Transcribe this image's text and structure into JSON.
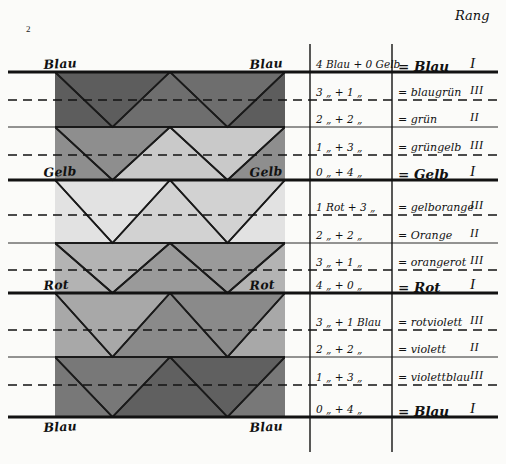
{
  "page": {
    "number": "2"
  },
  "headers": {
    "rank_column": "Rang"
  },
  "axis_labels": {
    "left": [
      {
        "text": "Blau",
        "y": 72
      },
      {
        "text": "Gelb",
        "y": 180
      },
      {
        "text": "Rot",
        "y": 293
      },
      {
        "text": "Blau",
        "y": 435
      }
    ],
    "right": [
      {
        "text": "Blau",
        "y": 72
      },
      {
        "text": "Gelb",
        "y": 180
      },
      {
        "text": "Rot",
        "y": 293
      },
      {
        "text": "Blau",
        "y": 435
      }
    ]
  },
  "colors": {
    "ink": "#111111",
    "paper": "#fbfbf9",
    "tone_blau": "#5d5d5d",
    "tone_blaugruen": "#6e6e6e",
    "tone_gruen": "#8e8e8e",
    "tone_gruengelb": "#c9c9c9",
    "tone_gelb": "#e2e2e2",
    "tone_gelborange": "#d2d2d2",
    "tone_orange": "#b3b3b3",
    "tone_orangerot": "#9a9a9a",
    "tone_rot": "#a8a8a8",
    "tone_rotviolett": "#8a8a8a",
    "tone_violett": "#787878",
    "tone_violettblau": "#606060"
  },
  "chart_data": {
    "type": "table",
    "columns": [
      "Mischung",
      "Ergebnis",
      "Rang"
    ],
    "rows": [
      {
        "mix": "4 Blau + 0 Gelb",
        "result": "= Blau",
        "rank": "I",
        "major": true,
        "sep": "thick"
      },
      {
        "mix": "3  „  + 1  „",
        "result": "= blaugrün",
        "rank": "III",
        "major": false,
        "sep": "dashed"
      },
      {
        "mix": "2  „  + 2  „",
        "result": "= grün",
        "rank": "II",
        "major": false,
        "sep": "solid"
      },
      {
        "mix": "1  „  + 3  „",
        "result": "= grüngelb",
        "rank": "III",
        "major": false,
        "sep": "dashed"
      },
      {
        "mix": "0  „  + 4  „",
        "result": "= Gelb",
        "rank": "I",
        "major": true,
        "sep": "thick"
      },
      {
        "mix": "1 Rot + 3  „",
        "result": "= gelborange",
        "rank": "III",
        "major": false,
        "sep": "dashed"
      },
      {
        "mix": "2  „  + 2  „",
        "result": "= Orange",
        "rank": "II",
        "major": false,
        "sep": "solid"
      },
      {
        "mix": "3  „  + 1  „",
        "result": "= orangerot",
        "rank": "III",
        "major": false,
        "sep": "dashed"
      },
      {
        "mix": "4  „  + 0  „",
        "result": "= Rot",
        "rank": "I",
        "major": true,
        "sep": "thick"
      },
      {
        "mix": "3  „  + 1 Blau",
        "result": "= rotviolett",
        "rank": "III",
        "major": false,
        "sep": "dashed"
      },
      {
        "mix": "2  „  + 2  „",
        "result": "= violett",
        "rank": "II",
        "major": false,
        "sep": "solid"
      },
      {
        "mix": "1  „  + 3  „",
        "result": "= violettblau",
        "rank": "III",
        "major": false,
        "sep": "dashed"
      },
      {
        "mix": "0  „  + 4  „",
        "result": "= Blau",
        "rank": "I",
        "major": true,
        "sep": "thick"
      }
    ],
    "row_y": [
      72,
      100,
      127,
      155,
      180,
      215,
      243,
      270,
      293,
      330,
      357,
      385,
      417
    ],
    "xlabel": "",
    "ylabel": "",
    "grid": true,
    "legend": "none"
  },
  "table_geometry": {
    "col_divider_1_x": 310,
    "col_divider_2_x": 392,
    "mix_text_x": 316,
    "result_text_x": 398,
    "rank_text_x": 470
  }
}
